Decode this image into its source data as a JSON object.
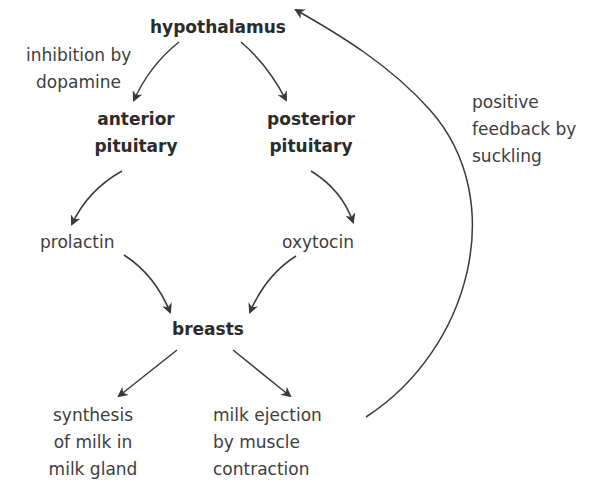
{
  "diagram": {
    "colors": {
      "text": "#3d3d3d",
      "bold_text": "#2b2b2b",
      "arrow": "#3a3a3a",
      "background": "#ffffff"
    },
    "nodes": {
      "hypothalamus": {
        "label": "hypothalamus",
        "bold": true
      },
      "anterior_pituitary": {
        "lines": [
          "anterior",
          "pituitary"
        ],
        "bold": true
      },
      "posterior_pituitary": {
        "lines": [
          "posterior",
          "pituitary"
        ],
        "bold": true
      },
      "prolactin": {
        "label": "prolactin"
      },
      "oxytocin": {
        "label": "oxytocin"
      },
      "breasts": {
        "label": "breasts",
        "bold": true
      },
      "synthesis": {
        "lines": [
          "synthesis",
          "of milk in",
          "milk gland"
        ]
      },
      "milk_ejection": {
        "lines": [
          "milk ejection",
          "by muscle",
          "contraction"
        ]
      }
    },
    "annotations": {
      "inhibition": {
        "lines": [
          "inhibition by",
          "dopamine"
        ]
      },
      "feedback": {
        "lines": [
          "positive",
          "feedback by",
          "suckling"
        ]
      }
    },
    "edges": [
      {
        "from": "hypothalamus",
        "to": "anterior_pituitary",
        "label": "inhibition by dopamine"
      },
      {
        "from": "hypothalamus",
        "to": "posterior_pituitary"
      },
      {
        "from": "anterior_pituitary",
        "to": "prolactin"
      },
      {
        "from": "posterior_pituitary",
        "to": "oxytocin"
      },
      {
        "from": "prolactin",
        "to": "breasts"
      },
      {
        "from": "oxytocin",
        "to": "breasts"
      },
      {
        "from": "breasts",
        "to": "synthesis"
      },
      {
        "from": "breasts",
        "to": "milk_ejection"
      },
      {
        "from": "milk_ejection",
        "to": "hypothalamus",
        "label": "positive feedback by suckling"
      }
    ]
  }
}
